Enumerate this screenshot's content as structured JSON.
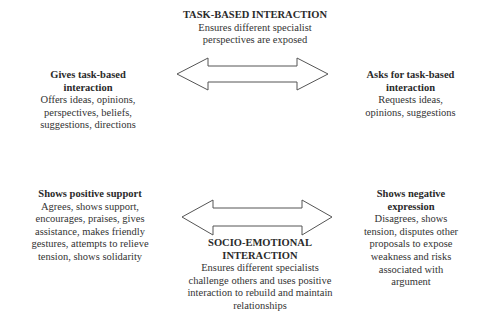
{
  "diagram": {
    "task_based": {
      "title": "TASK-BASED INTERACTION",
      "desc": "Ensures different specialist perspectives are exposed",
      "desc_lines": [
        "Ensures different specialist",
        "perspectives are exposed"
      ]
    },
    "gives_task": {
      "title_lines": [
        "Gives task-based",
        "interaction"
      ],
      "desc_lines": [
        "Offers ideas, opinions,",
        "perspectives, beliefs,",
        "suggestions, directions"
      ]
    },
    "asks_task": {
      "title_lines": [
        "Asks for task-based",
        "interaction"
      ],
      "desc_lines": [
        "Requests ideas,",
        "opinions, suggestions"
      ]
    },
    "positive_support": {
      "title_lines": [
        "Shows positive support"
      ],
      "desc_lines": [
        "Agrees, shows support,",
        "encourages, praises, gives",
        "assistance, makes friendly",
        "gestures, attempts to relieve",
        "tension, shows solidarity"
      ]
    },
    "negative_expression": {
      "title_lines": [
        "Shows negative",
        "expression"
      ],
      "desc_lines": [
        "Disagrees, shows",
        "tension, disputes other",
        "proposals to expose",
        "weakness and risks",
        "associated with",
        "argument"
      ]
    },
    "socio_emotional": {
      "title_lines": [
        "SOCIO-EMOTIONAL",
        "INTERACTION"
      ],
      "desc_lines": [
        "Ensures different specialists",
        "challenge others and uses positive",
        "interaction to rebuild and maintain",
        "relationships"
      ]
    },
    "arrows": [
      {
        "name": "task-based-arrow",
        "direction": "bidirectional",
        "stroke": "#555555"
      },
      {
        "name": "socio-emotional-arrow",
        "direction": "bidirectional",
        "stroke": "#555555"
      }
    ]
  }
}
